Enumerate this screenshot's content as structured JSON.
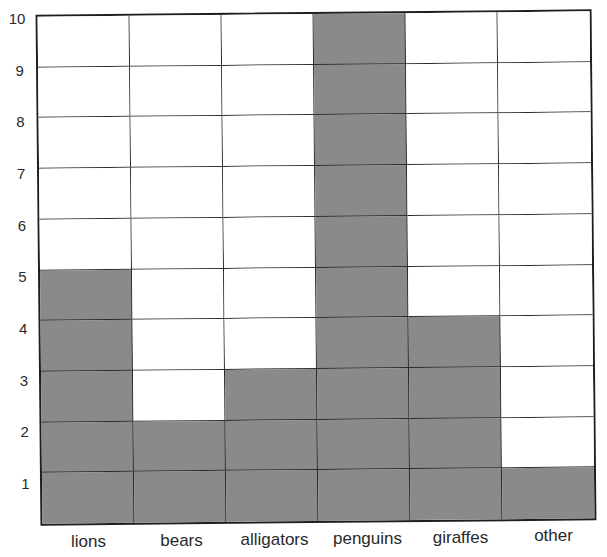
{
  "chart_data": {
    "type": "bar",
    "title": "",
    "title_note": "title cropped at top edge (illegible)",
    "categories": [
      "lions",
      "bears",
      "alligators",
      "penguins",
      "giraffes",
      "other"
    ],
    "values": [
      5,
      2,
      3,
      10,
      4,
      1
    ],
    "xlabel": "",
    "ylabel": "",
    "ylim": [
      0,
      10
    ],
    "yticks": [
      "1",
      "2",
      "3",
      "4",
      "5",
      "6",
      "7",
      "8",
      "9",
      "10"
    ],
    "grid": true,
    "style": "pictograph grid bar chart (filled squares)",
    "legend": null
  },
  "colors": {
    "filled": "#8a8a8a",
    "empty": "#ffffff",
    "lines": "#1e1e1e"
  }
}
